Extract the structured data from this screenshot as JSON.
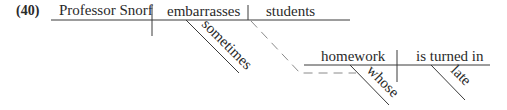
{
  "example_number": "(40)",
  "main_clause": {
    "subject": "Professor Snorf",
    "verb": "embarrasses",
    "verb_modifier": "sometimes",
    "direct_object": "students"
  },
  "relative_clause": {
    "subject": "homework",
    "subject_modifier": "whose",
    "verb": "is turned in",
    "verb_modifier": "late"
  },
  "colors": {
    "line": "#3a3a3a",
    "dashed_line": "#8a8a8a",
    "text": "#2a2a2a"
  }
}
